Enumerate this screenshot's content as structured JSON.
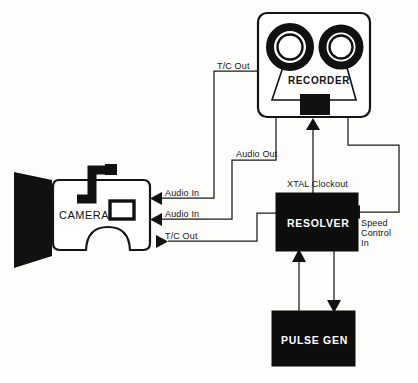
{
  "diagram": {
    "background_color": "#fdfdfb",
    "ink_color": "#111111",
    "devices": {
      "camera": {
        "label": "CAMERA",
        "ports": [
          {
            "name": "audio-in-1",
            "label": "Audio In",
            "direction": "in"
          },
          {
            "name": "audio-in-2",
            "label": "Audio In",
            "direction": "in"
          },
          {
            "name": "tc-out",
            "label": "T/C Out",
            "direction": "out"
          }
        ]
      },
      "recorder": {
        "label": "RECORDER",
        "ports": [
          {
            "name": "tc-out",
            "label": "T/C Out",
            "direction": "out"
          },
          {
            "name": "audio-out",
            "label": "Audio Out",
            "direction": "out"
          }
        ]
      },
      "resolver": {
        "label": "RESOLVER",
        "fill": "#0d0d0d",
        "text_color": "#ffffff",
        "ports": [
          {
            "name": "xtal-clockout",
            "label": "XTAL Clockout",
            "direction": "out"
          },
          {
            "name": "speed-control-in-line1",
            "label": "Speed",
            "direction": "in"
          },
          {
            "name": "speed-control-in-line2",
            "label": "Control",
            "direction": "in"
          },
          {
            "name": "speed-control-in-line3",
            "label": "In",
            "direction": "in"
          }
        ]
      },
      "pulse_gen": {
        "label": "PULSE GEN",
        "fill": "#0d0d0d",
        "text_color": "#ffffff"
      }
    },
    "connections": [
      {
        "name": "recorder-tc-out-to-camera-audio-in-1",
        "label": "T/C Out",
        "from": "recorder",
        "to": "camera"
      },
      {
        "name": "recorder-audio-out-to-camera-audio-in-2",
        "label": "Audio Out",
        "from": "recorder",
        "to": "camera"
      },
      {
        "name": "camera-tc-out-to-resolver",
        "label": "T/C Out",
        "from": "camera",
        "to": "resolver"
      },
      {
        "name": "resolver-xtal-clockout-to-recorder",
        "label": "XTAL Clockout",
        "from": "resolver",
        "to": "recorder"
      },
      {
        "name": "recorder-to-resolver-speed-control-in",
        "label": "Speed Control In",
        "from": "recorder",
        "to": "resolver"
      },
      {
        "name": "pulse-gen-to-resolver",
        "label": "",
        "from": "pulse_gen",
        "to": "resolver"
      },
      {
        "name": "resolver-to-pulse-gen",
        "label": "",
        "from": "resolver",
        "to": "pulse_gen"
      }
    ]
  }
}
